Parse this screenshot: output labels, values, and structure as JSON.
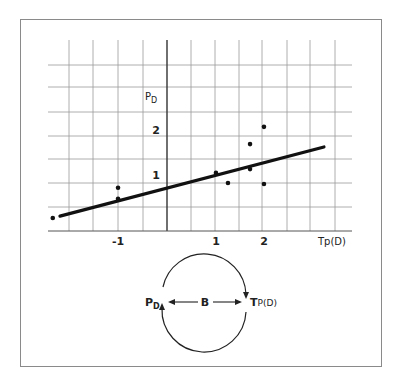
{
  "chart_data": {
    "type": "scatter",
    "title": "",
    "xlabel": "Tp(D)",
    "ylabel": "P_D",
    "ylabel_main": "P",
    "ylabel_sub": "D",
    "x_ticks": [
      {
        "value": -1,
        "label": "-1"
      },
      {
        "value": 1,
        "label": "1"
      },
      {
        "value": 2,
        "label": "2"
      }
    ],
    "y_ticks": [
      {
        "value": 1,
        "label": "1"
      },
      {
        "value": 2,
        "label": "2"
      }
    ],
    "xlim": [
      -2.5,
      3.8
    ],
    "ylim": [
      0,
      3.4
    ],
    "grid": true,
    "points": [
      {
        "x": -2.38,
        "y": 0.27
      },
      {
        "x": -1.02,
        "y": 0.9
      },
      {
        "x": -1.02,
        "y": 0.67
      },
      {
        "x": 1.02,
        "y": 1.21
      },
      {
        "x": 1.27,
        "y": 1.0
      },
      {
        "x": 1.73,
        "y": 1.81
      },
      {
        "x": 1.73,
        "y": 1.29
      },
      {
        "x": 2.02,
        "y": 2.17
      },
      {
        "x": 2.02,
        "y": 0.98
      }
    ],
    "fit_line": {
      "x0": -2.23,
      "y0": 0.31,
      "x1": 3.27,
      "y1": 1.75
    }
  },
  "diagram": {
    "left_label_main": "P",
    "left_label_sub": "D",
    "center_label": "B",
    "right_label_main": "T",
    "right_label_sub": "P(D)"
  }
}
